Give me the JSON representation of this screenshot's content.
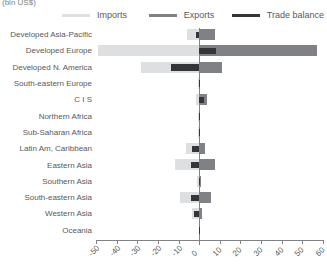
{
  "axis_unit_label": "(bln US$)",
  "legend": {
    "items": [
      {
        "key": "imports",
        "label": "Imports",
        "color": "#dedfe0"
      },
      {
        "key": "exports",
        "label": "Exports",
        "color": "#7f8184"
      },
      {
        "key": "balance",
        "label": "Trade balance",
        "color": "#333538"
      }
    ]
  },
  "chart_data": {
    "type": "bar",
    "orientation": "horizontal",
    "title": "",
    "subtitle": "",
    "xlabel": "(bln US$)",
    "ylabel": "",
    "xlim": [
      -50,
      60
    ],
    "xticks": [
      -50,
      -40,
      -30,
      -20,
      -10,
      0,
      10,
      20,
      30,
      40,
      50,
      60
    ],
    "xtick_labels": [
      "-50",
      "-40",
      "-30",
      "-20",
      "-10",
      "0",
      "10",
      "20",
      "30",
      "40",
      "50",
      "60"
    ],
    "grid": false,
    "legend_position": "top",
    "categories": [
      "Developed Asia-Pacific",
      "Developed Europe",
      "Developed N. America",
      "South-eastern Europe",
      "C I S",
      "Northern Africa",
      "Sub-Saharan Africa",
      "Latin Am, Caribbean",
      "Eastern Asia",
      "Southern Asia",
      "South-eastern Asia",
      "Western Asia",
      "Oceania"
    ],
    "series": [
      {
        "name": "Imports",
        "color": "#dedfe0",
        "values": [
          -6,
          -49,
          -28,
          -0.6,
          -1.6,
          -0.7,
          -0.7,
          -6.5,
          -11.5,
          -1.2,
          -9.5,
          -3.5,
          -0.3
        ]
      },
      {
        "name": "Exports",
        "color": "#7f8184",
        "values": [
          7.5,
          57,
          11,
          0.5,
          4,
          0.6,
          0.6,
          3,
          7.5,
          1.1,
          5.5,
          1.2,
          0.2
        ]
      },
      {
        "name": "Trade balance",
        "color": "#333538",
        "values": [
          -1.5,
          8,
          -13.5,
          -0.2,
          2.4,
          -0.2,
          -0.2,
          -3.5,
          -4,
          -0.2,
          -4,
          -2.3,
          -0.2
        ]
      }
    ]
  }
}
